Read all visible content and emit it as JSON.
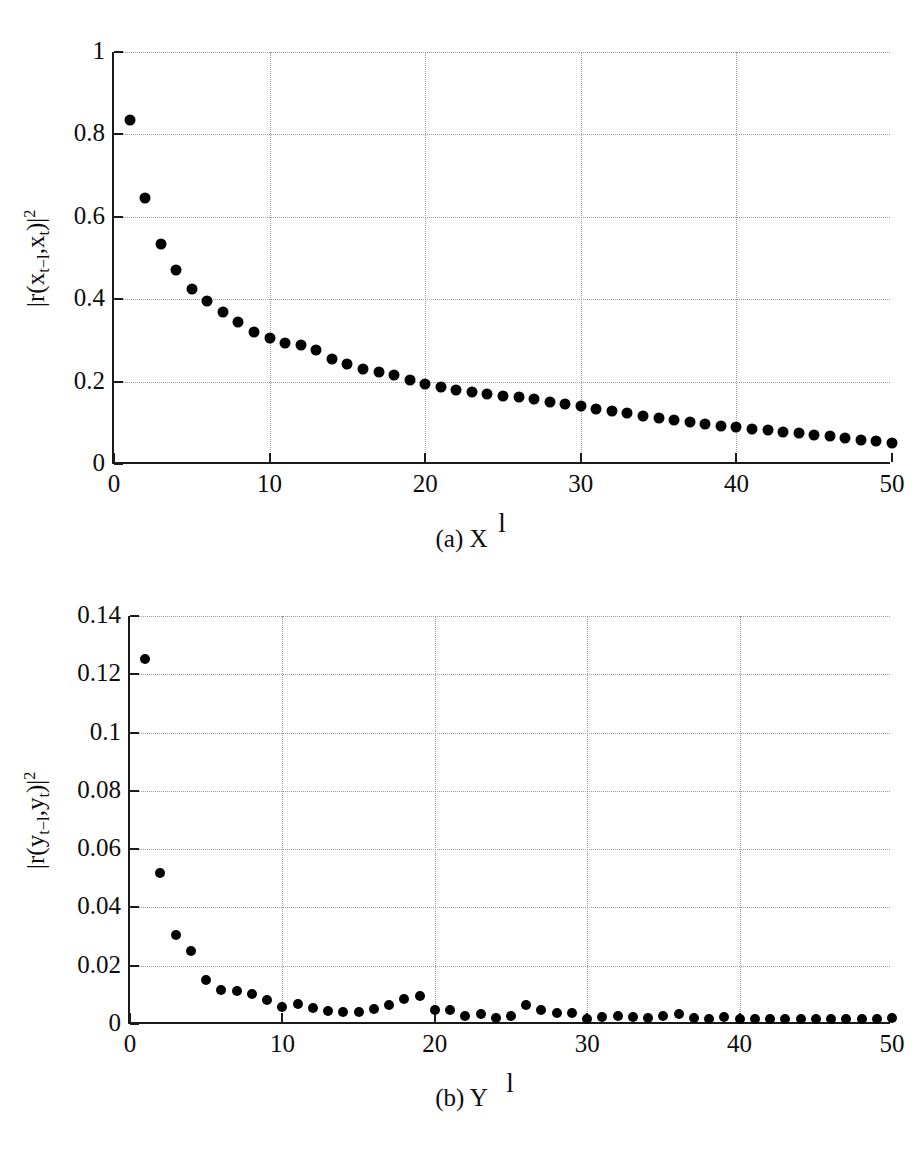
{
  "figure": {
    "panels": [
      {
        "id": "a",
        "caption": "(a)  X",
        "ylabel": "|r(x_{t-l},x_t)|^2",
        "xlabel": "l"
      },
      {
        "id": "b",
        "caption": "(b)  Y",
        "ylabel": "|r(y_{t-l},y_t)|^2",
        "xlabel": "l"
      }
    ]
  },
  "chart_data": [
    {
      "type": "scatter",
      "title": "(a)  X",
      "xlabel": "l",
      "ylabel": "|r(x_{t-l},x_t)|^2",
      "xlim": [
        0,
        50
      ],
      "ylim": [
        0,
        1
      ],
      "xticks": [
        0,
        10,
        20,
        30,
        40,
        50
      ],
      "yticks": [
        0,
        0.2,
        0.4,
        0.6,
        0.8,
        1
      ],
      "xticklabels": [
        "0",
        "10",
        "20",
        "30",
        "40",
        "50"
      ],
      "yticklabels": [
        "0",
        "0.2",
        "0.4",
        "0.6",
        "0.8",
        "1"
      ],
      "grid": true,
      "legend": null,
      "marker": "filled-circle",
      "marker_color": "#000000",
      "x": [
        1,
        2,
        3,
        4,
        5,
        6,
        7,
        8,
        9,
        10,
        11,
        12,
        13,
        14,
        15,
        16,
        17,
        18,
        19,
        20,
        21,
        22,
        23,
        24,
        25,
        26,
        27,
        28,
        29,
        30,
        31,
        32,
        33,
        34,
        35,
        36,
        37,
        38,
        39,
        40,
        41,
        42,
        43,
        44,
        45,
        46,
        47,
        48,
        49,
        50
      ],
      "y": [
        0.83,
        0.64,
        0.53,
        0.465,
        0.42,
        0.39,
        0.365,
        0.34,
        0.315,
        0.3,
        0.29,
        0.285,
        0.272,
        0.25,
        0.238,
        0.225,
        0.218,
        0.21,
        0.2,
        0.19,
        0.182,
        0.175,
        0.17,
        0.165,
        0.16,
        0.157,
        0.152,
        0.145,
        0.14,
        0.135,
        0.128,
        0.123,
        0.118,
        0.112,
        0.107,
        0.102,
        0.098,
        0.092,
        0.088,
        0.085,
        0.08,
        0.077,
        0.073,
        0.07,
        0.066,
        0.062,
        0.058,
        0.054,
        0.05,
        0.045
      ]
    },
    {
      "type": "scatter",
      "title": "(b)  Y",
      "xlabel": "l",
      "ylabel": "|r(y_{t-l},y_t)|^2",
      "xlim": [
        0,
        50
      ],
      "ylim": [
        0,
        0.14
      ],
      "xticks": [
        0,
        10,
        20,
        30,
        40,
        50
      ],
      "yticks": [
        0,
        0.02,
        0.04,
        0.06,
        0.08,
        0.1,
        0.12,
        0.14
      ],
      "xticklabels": [
        "0",
        "10",
        "20",
        "30",
        "40",
        "50"
      ],
      "yticklabels": [
        "0",
        "0.02",
        "0.04",
        "0.06",
        "0.08",
        "0.1",
        "0.12",
        "0.14"
      ],
      "grid": true,
      "legend": null,
      "marker": "filled-circle",
      "marker_color": "#000000",
      "x": [
        1,
        2,
        3,
        4,
        5,
        6,
        7,
        8,
        9,
        10,
        11,
        12,
        13,
        14,
        15,
        16,
        17,
        18,
        19,
        20,
        21,
        22,
        23,
        24,
        25,
        26,
        27,
        28,
        29,
        30,
        31,
        32,
        33,
        34,
        35,
        36,
        37,
        38,
        39,
        40,
        41,
        42,
        43,
        44,
        45,
        46,
        47,
        48,
        49,
        50
      ],
      "y": [
        0.1245,
        0.051,
        0.03,
        0.0245,
        0.0145,
        0.011,
        0.0105,
        0.0095,
        0.0075,
        0.005,
        0.0062,
        0.0048,
        0.0038,
        0.0035,
        0.0034,
        0.0045,
        0.006,
        0.0078,
        0.009,
        0.0042,
        0.004,
        0.0022,
        0.0028,
        0.0014,
        0.002,
        0.006,
        0.004,
        0.0032,
        0.003,
        0.0012,
        0.0016,
        0.002,
        0.0018,
        0.0014,
        0.0022,
        0.0026,
        0.0014,
        0.0012,
        0.0016,
        0.001,
        0.0012,
        0.001,
        0.0012,
        0.001,
        0.0012,
        0.001,
        0.0011,
        0.001,
        0.001,
        0.0014
      ]
    }
  ]
}
